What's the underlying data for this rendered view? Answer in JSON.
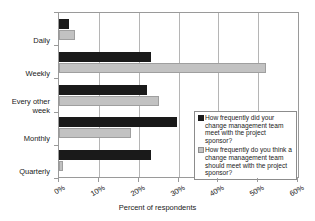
{
  "chart_data": {
    "type": "bar",
    "orientation": "horizontal",
    "title": "",
    "xlabel": "Percent of respondents",
    "ylabel": "",
    "xlim": [
      0,
      60
    ],
    "xticks": [
      "0%",
      "10%",
      "20%",
      "30%",
      "40%",
      "50%",
      "60%"
    ],
    "xtick_values": [
      0,
      10,
      20,
      30,
      40,
      50,
      60
    ],
    "grid": "vertical",
    "legend_position": "center-right inside plot",
    "categories": [
      "Daily",
      "Weekly",
      "Every other week",
      "Monthly",
      "Quarterly"
    ],
    "series": [
      {
        "name": "How frequently did your change management team meet with the project sponsor?",
        "color": "#1a1a1a",
        "values": [
          2.5,
          23,
          22,
          29.5,
          23
        ]
      },
      {
        "name": "How frequently do you think a change management team should meet with the project sponsor?",
        "color": "#c2c2c2",
        "values": [
          4,
          52,
          25,
          18,
          1
        ]
      }
    ]
  },
  "legend": {
    "entries": [
      {
        "swatch_name": "legend-swatch-series-1",
        "label": "How frequently did your change management team meet with the project sponsor?"
      },
      {
        "swatch_name": "legend-swatch-series-2",
        "label": "How frequently do you think a change management team should meet with the project sponsor?"
      }
    ]
  }
}
